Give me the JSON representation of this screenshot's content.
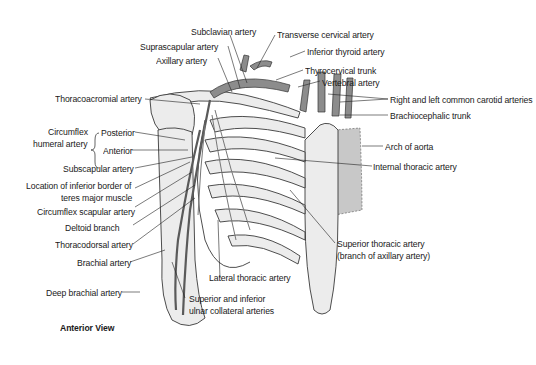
{
  "figure": {
    "view_label": "Anterior View",
    "labels": {
      "subclavian_artery": "Subclavian artery",
      "transverse_cervical_artery": "Transverse cervical artery",
      "suprascapular_artery": "Suprascapular artery",
      "inferior_thyroid_artery": "Inferior thyroid artery",
      "axillary_artery": "Axillary artery",
      "thyrocervical_trunk": "Thyrocervical trunk",
      "vertebral_artery": "Vertebral artery",
      "thoracoacromial_artery": "Thoracoacromial artery",
      "common_carotid_arteries": "Right and left common carotid arteries",
      "brachiocephalic_trunk": "Brachiocephalic trunk",
      "circumflex_humeral_line1": "Circumflex",
      "circumflex_humeral_line2": "humeral artery",
      "posterior": "Posterior",
      "anterior": "Anterior",
      "arch_of_aorta": "Arch of aorta",
      "subscapular_artery": "Subscapular artery",
      "internal_thoracic_artery": "Internal thoracic artery",
      "inferior_border_line1": "Location of inferior border of",
      "inferior_border_line2": "teres major muscle",
      "circumflex_scapular_artery": "Circumflex scapular artery",
      "deltoid_branch": "Deltoid branch",
      "superior_thoracic_line1": "Superior thoracic artery",
      "superior_thoracic_line2": "(branch of axillary artery)",
      "thoracodorsal_artery": "Thoracodorsal artery",
      "brachial_artery": "Brachial artery",
      "lateral_thoracic_artery": "Lateral thoracic artery",
      "deep_brachial_artery": "Deep brachial artery",
      "ulnar_collateral_line1": "Superior and inferior",
      "ulnar_collateral_line2": "ulnar collateral arteries"
    },
    "colors": {
      "bone_fill": "#ececec",
      "artery_fill": "#8c8c8c",
      "outline": "#3a3a3a",
      "leader": "#222222",
      "shade": "#c8c8c8"
    }
  }
}
